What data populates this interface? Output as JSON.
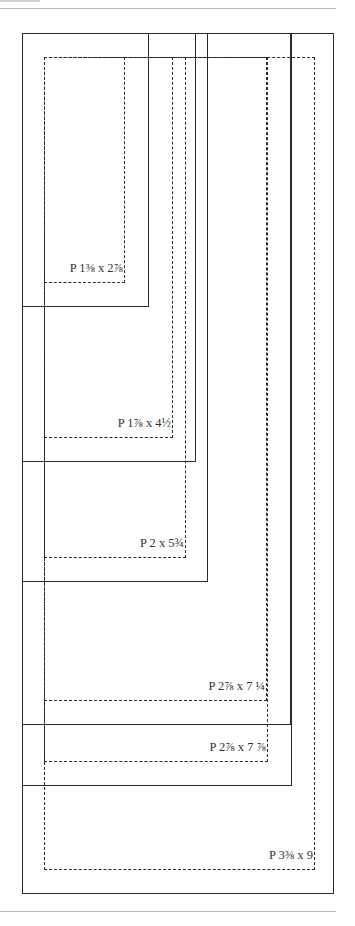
{
  "diagram": {
    "stroke_color": "#2a2a2a",
    "rule_color": "#b9b9b9",
    "boxes": [
      {
        "label": "P 1⅜ x 2⅞",
        "outer": {
          "x": 22,
          "y": 33,
          "w": 127,
          "h": 274
        },
        "inner": {
          "x": 44,
          "y": 57,
          "w": 81,
          "h": 226
        }
      },
      {
        "label": "P 1⅞ x 4½",
        "outer": {
          "x": 22,
          "y": 33,
          "w": 174,
          "h": 429
        },
        "inner": {
          "x": 44,
          "y": 57,
          "w": 129,
          "h": 381
        }
      },
      {
        "label": "P 2 x 5¾",
        "outer": {
          "x": 22,
          "y": 33,
          "w": 186,
          "h": 549
        },
        "inner": {
          "x": 44,
          "y": 57,
          "w": 142,
          "h": 501
        }
      },
      {
        "label": "P 2⅞ x 7 ¼",
        "outer": {
          "x": 22,
          "y": 33,
          "w": 269,
          "h": 692
        },
        "inner": {
          "x": 44,
          "y": 57,
          "w": 223,
          "h": 644
        }
      },
      {
        "label": "P 2⅞ x 7 ⅞",
        "outer": {
          "x": 22,
          "y": 33,
          "w": 270,
          "h": 753
        },
        "inner": {
          "x": 44,
          "y": 57,
          "w": 224,
          "h": 705
        }
      },
      {
        "label": "P 3⅜ x 9",
        "outer": {
          "x": 22,
          "y": 33,
          "w": 312,
          "h": 861
        },
        "inner": {
          "x": 44,
          "y": 57,
          "w": 271,
          "h": 813
        }
      }
    ]
  }
}
